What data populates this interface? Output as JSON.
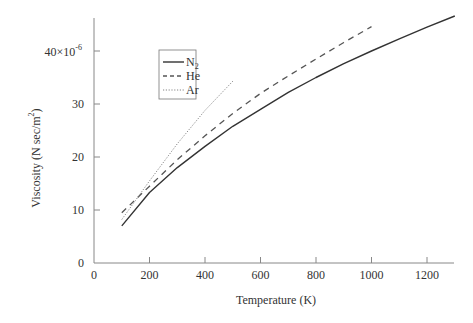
{
  "chart_data": {
    "type": "line",
    "title": "",
    "xlabel": "Temperature (K)",
    "ylabel": "Viscosity (N sec/m²)",
    "ylabel_parts": {
      "main": "Viscosity (N sec/m",
      "sup": "2",
      "close": ")"
    },
    "xlim": [
      0,
      1300
    ],
    "ylim": [
      0,
      46.5
    ],
    "y_scale_note": "×10⁻⁶",
    "x_ticks": [
      0,
      200,
      400,
      600,
      800,
      1000,
      1200
    ],
    "x_tick_labels": [
      "0",
      "200",
      "400",
      "600",
      "800",
      "1000",
      "1200"
    ],
    "y_ticks": [
      0,
      10,
      20,
      30,
      40
    ],
    "y_tick_labels": [
      "0",
      "10",
      "20",
      "30",
      "40×10⁻⁶"
    ],
    "y_top_label": {
      "base": "40×10",
      "sup": "-6"
    },
    "grid": false,
    "legend_position": "upper-left (inside plot)",
    "series": [
      {
        "name": "N2",
        "label_base": "N",
        "label_sub": "2",
        "style": "solid",
        "color": "#333333",
        "x": [
          100,
          200,
          300,
          400,
          500,
          600,
          700,
          800,
          900,
          1000,
          1100,
          1200,
          1300
        ],
        "values": [
          7.0,
          13.3,
          18.0,
          22.0,
          25.8,
          29.0,
          32.2,
          35.0,
          37.6,
          40.0,
          42.3,
          44.5,
          46.6
        ]
      },
      {
        "name": "He",
        "label_base": "He",
        "label_sub": "",
        "style": "dashed",
        "color": "#555555",
        "x": [
          100,
          200,
          300,
          400,
          500,
          600,
          700,
          800,
          900,
          1000
        ],
        "values": [
          9.5,
          14.5,
          19.5,
          24.0,
          28.2,
          32.0,
          35.3,
          38.5,
          41.6,
          44.6
        ]
      },
      {
        "name": "Ar",
        "label_base": "Ar",
        "label_sub": "",
        "style": "dotted",
        "color": "#777777",
        "x": [
          100,
          200,
          300,
          400,
          500
        ],
        "values": [
          8.2,
          15.5,
          22.5,
          28.8,
          34.3
        ]
      }
    ]
  },
  "colors": {
    "axis": "#888888",
    "text": "#333333",
    "background": "#ffffff"
  }
}
